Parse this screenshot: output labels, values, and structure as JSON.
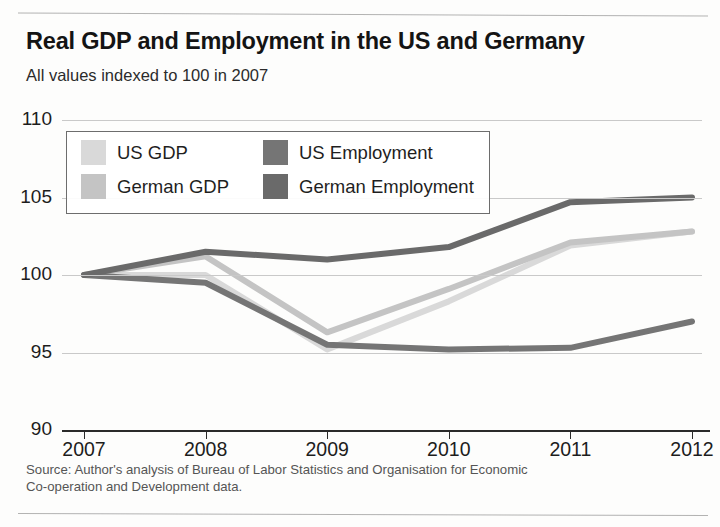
{
  "title": "Real GDP and Employment in the US and Germany",
  "subtitle": "All values indexed to 100 in 2007",
  "source_line_1": "Source: Author's analysis of Bureau of Labor Statistics and Organisation for Economic",
  "source_line_2": "Co-operation and Development data.",
  "legend": {
    "items": [
      {
        "label": "US GDP",
        "color": "#d9d9d9"
      },
      {
        "label": "US Employment",
        "color": "#757575"
      },
      {
        "label": "German GDP",
        "color": "#c4c4c4"
      },
      {
        "label": "German Employment",
        "color": "#6a6a6a"
      }
    ]
  },
  "chart_data": {
    "type": "line",
    "title": "Real GDP and Employment in the US and Germany",
    "subtitle": "All values indexed to 100 in 2007",
    "xlabel": "",
    "ylabel": "",
    "x": [
      2007,
      2008,
      2009,
      2010,
      2011,
      2012
    ],
    "categories": [
      "2007",
      "2008",
      "2009",
      "2010",
      "2011",
      "2012"
    ],
    "xlim": [
      2007,
      2012
    ],
    "ylim": [
      90,
      110
    ],
    "yticks": [
      90,
      95,
      100,
      105,
      110
    ],
    "xticks": [
      2007,
      2008,
      2009,
      2010,
      2011,
      2012
    ],
    "grid": true,
    "legend_position": "upper-left",
    "series": [
      {
        "name": "US GDP",
        "color": "#d9d9d9",
        "values": [
          100,
          100.0,
          95.2,
          98.3,
          101.9,
          102.8
        ]
      },
      {
        "name": "German GDP",
        "color": "#c4c4c4",
        "values": [
          100,
          101.2,
          96.3,
          99.1,
          102.1,
          102.8
        ]
      },
      {
        "name": "US Employment",
        "color": "#757575",
        "values": [
          100,
          99.5,
          95.5,
          95.2,
          95.3,
          97.0
        ]
      },
      {
        "name": "German Employment",
        "color": "#6a6a6a",
        "values": [
          100,
          101.5,
          101.0,
          101.8,
          104.7,
          105.0
        ]
      }
    ]
  }
}
